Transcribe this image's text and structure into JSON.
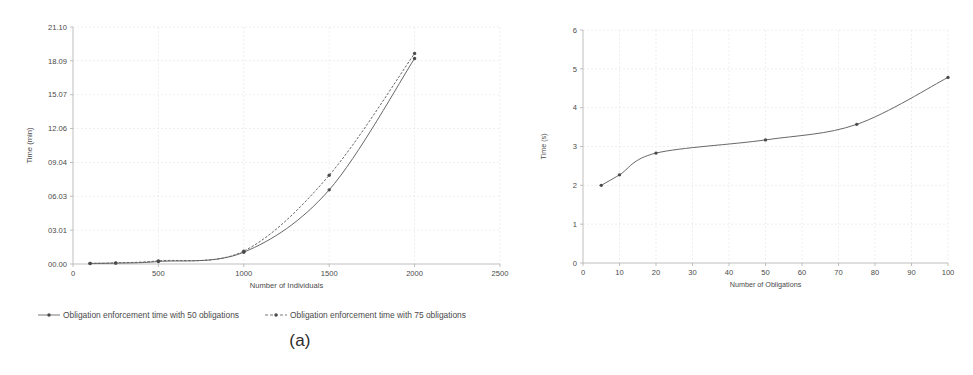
{
  "figure": {
    "caption_a": "(a)",
    "caption_b": "(b)"
  },
  "colors": {
    "line": "#5f5f5f",
    "marker": "#4a4a4a",
    "grid": "#e8e8e8",
    "axis": "#b8b8b8",
    "text": "#4a4a4a",
    "background": "#ffffff"
  },
  "chart_data": [
    {
      "type": "line",
      "title": "",
      "xlabel": "Number of Individuals",
      "ylabel": "Time (min)",
      "xlim": [
        0,
        2500
      ],
      "ylim": [
        0,
        21.1
      ],
      "grid": true,
      "legend_position": "bottom",
      "xticks": [
        0,
        500,
        1000,
        1500,
        2000,
        2500
      ],
      "xticklabels": [
        "0",
        "500",
        "1000",
        "1500",
        "2000",
        "2500"
      ],
      "yticks": [
        0,
        3.01,
        6.03,
        9.04,
        12.06,
        15.07,
        18.09,
        21.1
      ],
      "yticklabels": [
        "00.00",
        "03.01",
        "06.03",
        "09.04",
        "12.06",
        "15.07",
        "18.09",
        "21.10"
      ],
      "x": [
        100,
        250,
        500,
        1000,
        1500,
        2000
      ],
      "series": [
        {
          "name": "Obligation enforcement time with 50 obligations",
          "style": "solid",
          "values": [
            0.05,
            0.08,
            0.22,
            1.05,
            6.6,
            18.3
          ]
        },
        {
          "name": "Obligation enforcement time with 75 obligations",
          "style": "dashed",
          "values": [
            0.06,
            0.1,
            0.28,
            1.15,
            7.9,
            18.75
          ]
        }
      ]
    },
    {
      "type": "line",
      "title": "",
      "xlabel": "Number of Obligations",
      "ylabel": "Time (s)",
      "xlim": [
        0,
        100
      ],
      "ylim": [
        0,
        6
      ],
      "grid": true,
      "legend_position": "none",
      "xticks": [
        0,
        10,
        20,
        30,
        40,
        50,
        60,
        70,
        80,
        90,
        100
      ],
      "xticklabels": [
        "0",
        "10",
        "20",
        "30",
        "40",
        "50",
        "60",
        "70",
        "80",
        "90",
        "100"
      ],
      "yticks": [
        0,
        1,
        2,
        3,
        4,
        5,
        6
      ],
      "yticklabels": [
        "0",
        "1",
        "2",
        "3",
        "4",
        "5",
        "6"
      ],
      "x": [
        5,
        10,
        20,
        50,
        75,
        100
      ],
      "series": [
        {
          "name": "Policy evaluation time",
          "style": "solid",
          "values": [
            2.0,
            2.27,
            2.83,
            3.17,
            3.57,
            4.78
          ]
        }
      ]
    }
  ]
}
